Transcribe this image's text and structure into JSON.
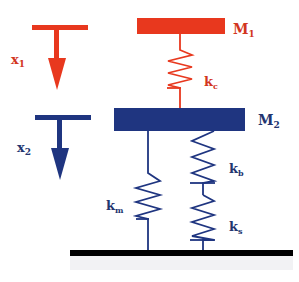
{
  "diagram": {
    "type": "two-mass spring system",
    "colors": {
      "red": "#e8381e",
      "blue": "#1f3580",
      "ground": "#000000",
      "label_red": "#d2361e",
      "label_blue": "#23356f"
    },
    "masses": [
      {
        "id": "m1",
        "label": "M",
        "sub": "1"
      },
      {
        "id": "m2",
        "label": "M",
        "sub": "2"
      }
    ],
    "displacements": [
      {
        "id": "x1",
        "label": "x",
        "sub": "1"
      },
      {
        "id": "x2",
        "label": "x",
        "sub": "2"
      }
    ],
    "springs": [
      {
        "id": "kc",
        "label": "k",
        "sub": "c",
        "connects": "M1-M2"
      },
      {
        "id": "km",
        "label": "k",
        "sub": "m",
        "connects": "M2-ground"
      },
      {
        "id": "kb",
        "label": "k",
        "sub": "b",
        "connects": "M2-ks"
      },
      {
        "id": "ks",
        "label": "k",
        "sub": "s",
        "connects": "kb-ground"
      }
    ],
    "ground": {
      "id": "ground",
      "label": ""
    }
  }
}
